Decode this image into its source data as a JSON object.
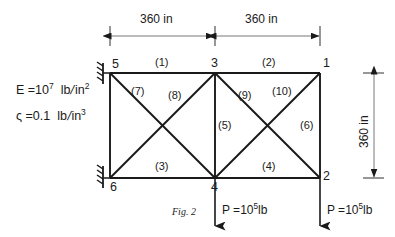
{
  "figure": {
    "caption": "Fig. 2",
    "material_properties": [
      {
        "name": "youngs-modulus",
        "symbol": "E",
        "text": "E =10",
        "exponent": "7",
        "unit_num": "lb",
        "unit_den": "in",
        "unit_den_exp": "2"
      },
      {
        "name": "density",
        "symbol": "ς",
        "text": "ς =0.1",
        "exponent": "",
        "unit_num": "lb",
        "unit_den": "in",
        "unit_den_exp": "3"
      }
    ],
    "dimensions": {
      "top_left_span": "360 in",
      "top_right_span": "360 in",
      "right_height": "360 in"
    },
    "nodes": [
      {
        "id": "1",
        "label": "1",
        "x": 320,
        "y": 73,
        "support": false
      },
      {
        "id": "2",
        "label": "2",
        "x": 320,
        "y": 178,
        "support": false
      },
      {
        "id": "3",
        "label": "3",
        "x": 215,
        "y": 73,
        "support": false
      },
      {
        "id": "4",
        "label": "4",
        "x": 215,
        "y": 178,
        "support": false
      },
      {
        "id": "5",
        "label": "5",
        "x": 110,
        "y": 73,
        "support": true
      },
      {
        "id": "6",
        "label": "6",
        "x": 110,
        "y": 178,
        "support": true
      }
    ],
    "members": [
      {
        "id": "1",
        "label": "(1)",
        "from": "5",
        "to": "3"
      },
      {
        "id": "2",
        "label": "(2)",
        "from": "3",
        "to": "1"
      },
      {
        "id": "3",
        "label": "(3)",
        "from": "6",
        "to": "4"
      },
      {
        "id": "4",
        "label": "(4)",
        "from": "4",
        "to": "2"
      },
      {
        "id": "5",
        "label": "(5)",
        "from": "3",
        "to": "4"
      },
      {
        "id": "6",
        "label": "(6)",
        "from": "1",
        "to": "2"
      },
      {
        "id": "7",
        "label": "(7)",
        "from": "5",
        "to": "4"
      },
      {
        "id": "8",
        "label": "(8)",
        "from": "6",
        "to": "3"
      },
      {
        "id": "9",
        "label": "(9)",
        "from": "3",
        "to": "2"
      },
      {
        "id": "10",
        "label": "(10)",
        "from": "4",
        "to": "1"
      }
    ],
    "loads": [
      {
        "at_node": "4",
        "text": "P =10",
        "exponent": "5",
        "unit": "lb"
      },
      {
        "at_node": "2",
        "text": "P =10",
        "exponent": "5",
        "unit": "lb"
      }
    ],
    "colors": {
      "line": "#1a1a1a",
      "background": "#ffffff"
    }
  }
}
